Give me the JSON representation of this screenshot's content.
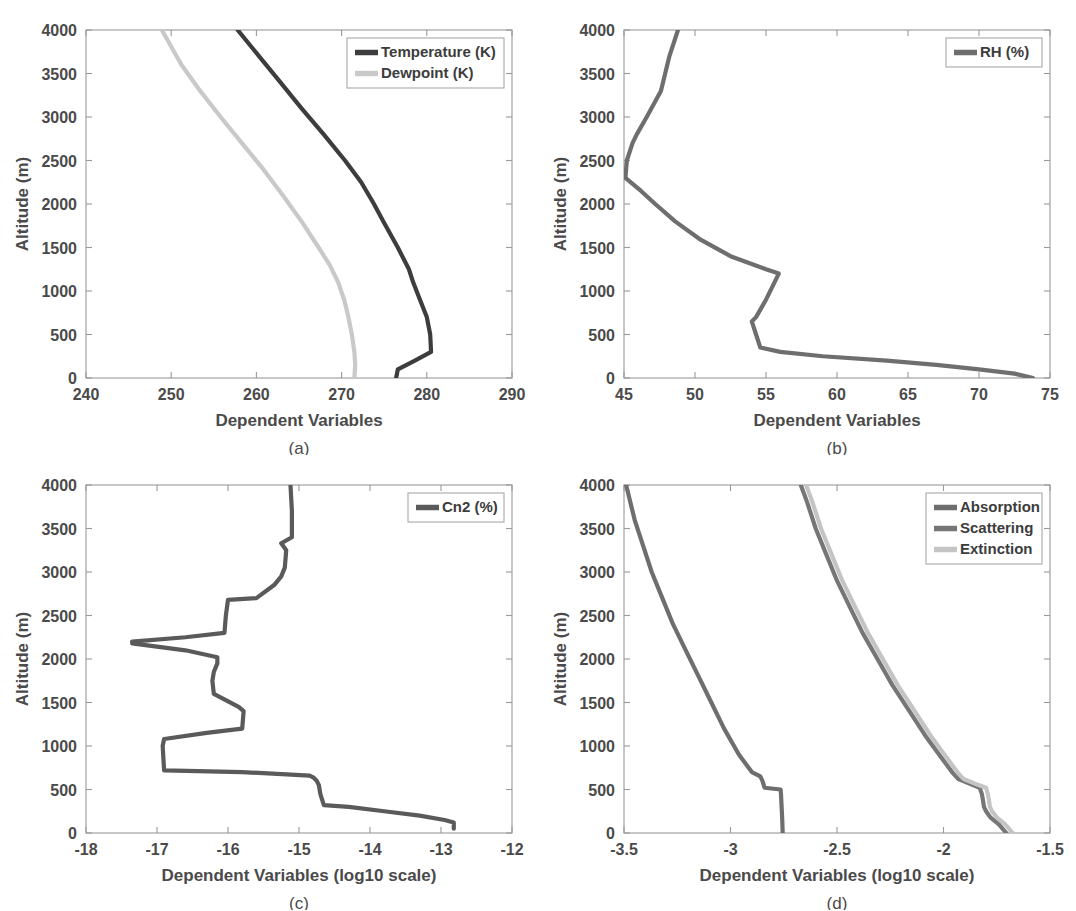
{
  "figure": {
    "background": "#ffffff",
    "panel_labels": [
      "(a)",
      "(b)",
      "(c)",
      "(d)"
    ]
  },
  "colors": {
    "temperature": "#3d3d3d",
    "dewpoint": "#c9c9c9",
    "rh": "#6e6e6e",
    "cn2": "#5a5a5a",
    "absorption": "#6e6e6e",
    "scattering": "#767676",
    "extinction": "#c4c4c4",
    "axis": "#9a9a9a",
    "text": "#4a4a4a"
  },
  "chart_data": [
    {
      "type": "line",
      "panel": "(a)",
      "title": "",
      "xlabel": "Dependent Variables",
      "ylabel": "Altitude (m)",
      "xlim": [
        240,
        290
      ],
      "ylim": [
        0,
        4000
      ],
      "xticks": [
        240,
        250,
        260,
        270,
        280,
        290
      ],
      "yticks": [
        0,
        500,
        1000,
        1500,
        2000,
        2500,
        3000,
        3500,
        4000
      ],
      "grid": false,
      "legend_position": "top-right",
      "orientation": "value-on-x, altitude-on-y",
      "series": [
        {
          "name": "Temperature (K)",
          "color": "#3d3d3d",
          "altitude": [
            0,
            100,
            200,
            300,
            500,
            700,
            900,
            1100,
            1250,
            1500,
            1800,
            2000,
            2250,
            2500,
            2800,
            3100,
            3400,
            3700,
            4000
          ],
          "values": [
            276.4,
            276.6,
            278.6,
            280.5,
            280.4,
            280.0,
            279.2,
            278.4,
            277.9,
            276.6,
            274.9,
            273.8,
            272.3,
            270.4,
            267.9,
            265.3,
            262.8,
            260.3,
            257.8
          ]
        },
        {
          "name": "Dewpoint (K)",
          "color": "#c9c9c9",
          "altitude": [
            0,
            150,
            300,
            500,
            700,
            900,
            1100,
            1300,
            1500,
            1800,
            2100,
            2400,
            2700,
            3000,
            3300,
            3600,
            4000
          ],
          "values": [
            271.5,
            271.6,
            271.5,
            271.2,
            270.8,
            270.3,
            269.6,
            268.6,
            267.3,
            265.3,
            263.1,
            260.8,
            258.3,
            255.8,
            253.4,
            251.2,
            248.9
          ]
        }
      ]
    },
    {
      "type": "line",
      "panel": "(b)",
      "title": "",
      "xlabel": "Dependent Variables",
      "ylabel": "Altitude (m)",
      "xlim": [
        45,
        75
      ],
      "ylim": [
        0,
        4000
      ],
      "xticks": [
        45,
        50,
        55,
        60,
        65,
        70,
        75
      ],
      "yticks": [
        0,
        500,
        1000,
        1500,
        2000,
        2500,
        3000,
        3500,
        4000
      ],
      "grid": false,
      "legend_position": "top-right",
      "orientation": "value-on-x, altitude-on-y",
      "series": [
        {
          "name": "RH (%)",
          "color": "#6e6e6e",
          "altitude": [
            0,
            50,
            100,
            150,
            200,
            250,
            300,
            350,
            500,
            650,
            700,
            900,
            1100,
            1200,
            1250,
            1400,
            1600,
            1800,
            2000,
            2150,
            2300,
            2500,
            2700,
            2800,
            3000,
            3300,
            3500,
            3700,
            4000
          ],
          "values": [
            73.8,
            72.5,
            70.0,
            67.0,
            63.5,
            59.0,
            56.0,
            54.6,
            54.3,
            54.0,
            54.3,
            55.0,
            55.6,
            55.9,
            55.0,
            52.5,
            50.3,
            48.6,
            47.2,
            46.2,
            45.1,
            45.2,
            45.6,
            45.9,
            46.6,
            47.6,
            47.9,
            48.2,
            48.8
          ]
        }
      ]
    },
    {
      "type": "line",
      "panel": "(c)",
      "title": "",
      "xlabel": "Dependent Variables (log10 scale)",
      "ylabel": "Altitude (m)",
      "xlim": [
        -18,
        -12
      ],
      "ylim": [
        0,
        4000
      ],
      "xticks": [
        -18,
        -17,
        -16,
        -15,
        -14,
        -13,
        -12
      ],
      "yticks": [
        0,
        500,
        1000,
        1500,
        2000,
        2500,
        3000,
        3500,
        4000
      ],
      "grid": false,
      "legend_position": "top-right",
      "orientation": "value-on-x, altitude-on-y",
      "series": [
        {
          "name": "Cn2 (%)",
          "color": "#5a5a5a",
          "altitude": [
            50,
            120,
            150,
            200,
            250,
            300,
            320,
            450,
            550,
            600,
            640,
            660,
            700,
            720,
            1000,
            1080,
            1150,
            1200,
            1400,
            1450,
            1600,
            1750,
            1850,
            1950,
            2020,
            2100,
            2180,
            2200,
            2250,
            2300,
            2500,
            2680,
            2700,
            2850,
            2950,
            3050,
            3250,
            3330,
            3400,
            3500,
            3700,
            4000
          ],
          "values": [
            -12.82,
            -12.82,
            -12.95,
            -13.3,
            -13.8,
            -14.3,
            -14.65,
            -14.7,
            -14.72,
            -14.75,
            -14.8,
            -14.85,
            -15.8,
            -16.9,
            -16.92,
            -16.9,
            -16.3,
            -15.8,
            -15.78,
            -15.85,
            -16.2,
            -16.22,
            -16.2,
            -16.15,
            -16.15,
            -16.6,
            -17.35,
            -17.35,
            -16.6,
            -16.05,
            -16.03,
            -16.0,
            -15.6,
            -15.35,
            -15.25,
            -15.2,
            -15.18,
            -15.25,
            -15.1,
            -15.1,
            -15.1,
            -15.12
          ]
        }
      ]
    },
    {
      "type": "line",
      "panel": "(d)",
      "title": "",
      "xlabel": "Dependent Variables (log10 scale)",
      "ylabel": "Altitude (m)",
      "xlim": [
        -3.5,
        -1.5
      ],
      "ylim": [
        0,
        4000
      ],
      "xticks": [
        -3.5,
        -3,
        -2.5,
        -2,
        -1.5
      ],
      "yticks": [
        0,
        500,
        1000,
        1500,
        2000,
        2500,
        3000,
        3500,
        4000
      ],
      "grid": false,
      "legend_position": "top-right",
      "orientation": "value-on-x, altitude-on-y",
      "series": [
        {
          "name": "Absorption",
          "color": "#6e6e6e",
          "altitude": [
            0,
            150,
            300,
            450,
            500,
            520,
            600,
            650,
            700,
            900,
            1200,
            1500,
            1800,
            2100,
            2400,
            2700,
            3000,
            3300,
            3600,
            4000
          ],
          "values": [
            -2.755,
            -2.757,
            -2.76,
            -2.763,
            -2.765,
            -2.84,
            -2.85,
            -2.86,
            -2.9,
            -2.96,
            -3.03,
            -3.09,
            -3.15,
            -3.21,
            -3.27,
            -3.32,
            -3.37,
            -3.41,
            -3.45,
            -3.49
          ]
        },
        {
          "name": "Scattering",
          "color": "#767676",
          "altitude": [
            0,
            100,
            180,
            250,
            300,
            380,
            450,
            520,
            560,
            620,
            700,
            900,
            1100,
            1400,
            1700,
            2000,
            2300,
            2600,
            2900,
            3200,
            3500,
            3800,
            4000
          ],
          "values": [
            -1.705,
            -1.74,
            -1.78,
            -1.8,
            -1.81,
            -1.815,
            -1.82,
            -1.83,
            -1.87,
            -1.93,
            -1.96,
            -2.02,
            -2.08,
            -2.16,
            -2.24,
            -2.31,
            -2.38,
            -2.44,
            -2.5,
            -2.55,
            -2.6,
            -2.64,
            -2.67
          ]
        },
        {
          "name": "Extinction",
          "color": "#c4c4c4",
          "altitude": [
            0,
            100,
            180,
            250,
            300,
            380,
            450,
            520,
            560,
            620,
            700,
            900,
            1100,
            1400,
            1700,
            2000,
            2300,
            2600,
            2900,
            3200,
            3500,
            3800,
            4000
          ],
          "values": [
            -1.675,
            -1.71,
            -1.75,
            -1.772,
            -1.782,
            -1.787,
            -1.792,
            -1.8,
            -1.845,
            -1.905,
            -1.935,
            -1.995,
            -2.055,
            -2.135,
            -2.215,
            -2.285,
            -2.355,
            -2.415,
            -2.475,
            -2.525,
            -2.575,
            -2.615,
            -2.645
          ]
        }
      ]
    }
  ]
}
